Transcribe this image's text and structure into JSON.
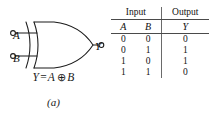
{
  "figure": {
    "caption_a": "(a)",
    "caption_b": "(b)"
  },
  "gate": {
    "type": "xor-gate",
    "input_a_label": "A",
    "input_b_label": "B",
    "output_label": "Y",
    "equation": {
      "lhs": "Y",
      "equals": "=",
      "operand_left": "A",
      "operator": "⊕",
      "operand_right": "B"
    }
  },
  "truth_table": {
    "group_headers": {
      "input": "Input",
      "output": "Output"
    },
    "column_headers": [
      "A",
      "B",
      "Y"
    ],
    "rows": [
      [
        "0",
        "0",
        "0"
      ],
      [
        "0",
        "1",
        "1"
      ],
      [
        "1",
        "0",
        "1"
      ],
      [
        "1",
        "1",
        "0"
      ]
    ]
  },
  "colors": {
    "background": "#ffffff",
    "ink": "#1a1a1a",
    "rule": "#4a4a4a"
  }
}
